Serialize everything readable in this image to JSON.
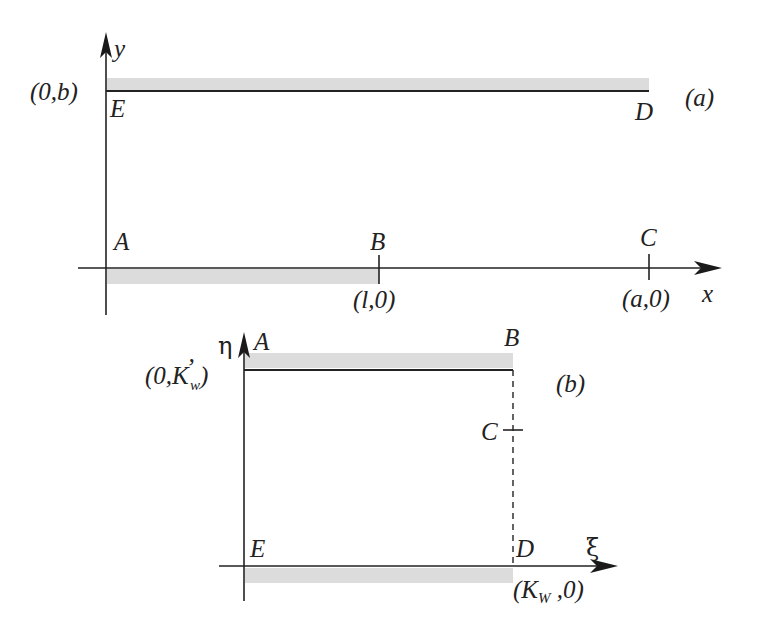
{
  "figure": {
    "panel_a": {
      "tag": "(a)",
      "axes": {
        "x_label": "x",
        "y_label": "y"
      },
      "points": {
        "A": "A",
        "B": "B",
        "C": "C",
        "D": "D",
        "E": "E"
      },
      "coordinates": {
        "E": "(0,b)",
        "B": "(l,0)",
        "C": "(a,0)"
      }
    },
    "panel_b": {
      "tag": "(b)",
      "axes": {
        "x_label": "ξ",
        "y_label": "η"
      },
      "points": {
        "A": "A",
        "B": "B",
        "C": "C",
        "D": "D",
        "E": "E"
      },
      "coordinates": {
        "A_prefix": "(0,K",
        "A_sub": "w",
        "A_prime": "’",
        "A_suffix": ")",
        "D_prefix": "(K",
        "D_sub": "W",
        "D_suffix": " ,0)"
      }
    },
    "colors": {
      "line": "#222222",
      "shading": "#dcdcdc",
      "background": "#ffffff"
    }
  }
}
